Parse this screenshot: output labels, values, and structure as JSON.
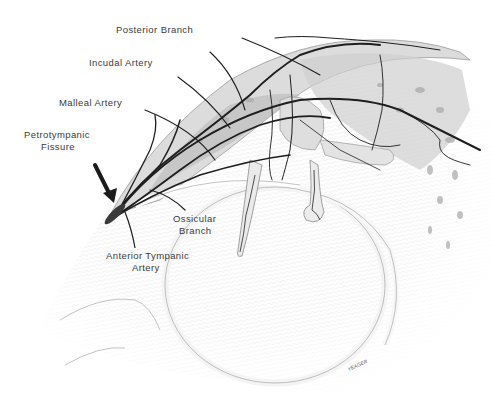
{
  "figure": {
    "type": "anatomical-illustration",
    "labels": [
      {
        "id": "posterior-branch",
        "text": "Posterior Branch",
        "x": 116,
        "y": 24
      },
      {
        "id": "incudal-artery",
        "text": "Incudal Artery",
        "x": 89,
        "y": 57
      },
      {
        "id": "malleal-artery",
        "text": "Malleal Artery",
        "x": 59,
        "y": 97
      },
      {
        "id": "petrotympanic-fissure-1",
        "text": "Petrotympanic",
        "x": 24,
        "y": 129
      },
      {
        "id": "petrotympanic-fissure-2",
        "text": "Fissure",
        "x": 41,
        "y": 141
      },
      {
        "id": "ossicular-branch-1",
        "text": "Ossicular",
        "x": 173,
        "y": 213
      },
      {
        "id": "ossicular-branch-2",
        "text": "Branch",
        "x": 179,
        "y": 225
      },
      {
        "id": "anterior-tympanic-1",
        "text": "Anterior Tympanic",
        "x": 106,
        "y": 250
      },
      {
        "id": "anterior-tympanic-2",
        "text": "Artery",
        "x": 132,
        "y": 262
      }
    ],
    "signature": "YEAGER",
    "colors": {
      "background": "#ffffff",
      "vessel": "#1e1e1e",
      "label": "#3a3a3a",
      "shade_dark": "#9a9a9a",
      "shade_light": "#d9d9d9"
    }
  }
}
